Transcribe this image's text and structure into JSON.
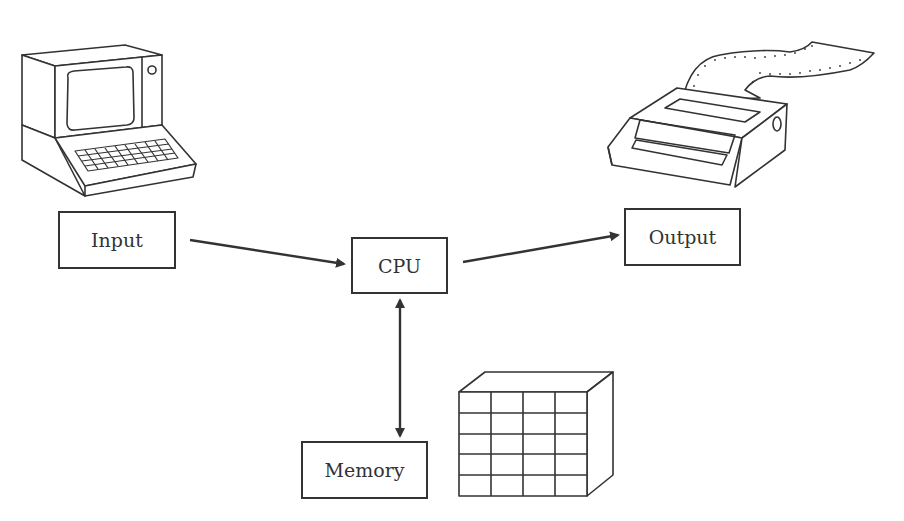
{
  "diagram": {
    "title": "",
    "nodes": [
      {
        "id": "input",
        "label": "Input"
      },
      {
        "id": "cpu",
        "label": "CPU"
      },
      {
        "id": "output",
        "label": "Output"
      },
      {
        "id": "memory",
        "label": "Memory"
      }
    ],
    "edges": [
      {
        "from": "input",
        "to": "cpu",
        "direction": "one-way"
      },
      {
        "from": "cpu",
        "to": "output",
        "direction": "one-way"
      },
      {
        "from": "cpu",
        "to": "memory",
        "direction": "two-way"
      }
    ],
    "illustrations": [
      {
        "id": "terminal",
        "icon": "computer-terminal-icon",
        "near": "input"
      },
      {
        "id": "printer",
        "icon": "printer-icon",
        "near": "output"
      },
      {
        "id": "memory-grid",
        "icon": "memory-grid-cube-icon",
        "near": "memory",
        "rows": 5,
        "cols": 4
      }
    ],
    "colors": {
      "line": "#333333",
      "background": "#ffffff"
    }
  }
}
